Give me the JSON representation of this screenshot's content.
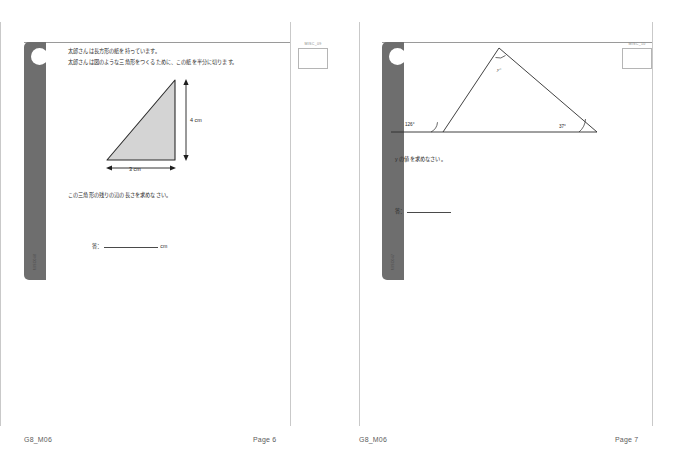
{
  "document": {
    "worksheet_code": "G8_M06"
  },
  "pages": [
    {
      "id": "page-6",
      "code_box_label": "MISC_09",
      "binder_id": "MISC048",
      "stem_lines": [
        "太郎さんは長方形の紙を持っています。",
        "太郎さんは図のような三角形をつくるために、この紙を半分に切ります。"
      ],
      "figure": {
        "type": "right-triangle",
        "vertical_label": "4 cm",
        "base_label": "3 cm"
      },
      "prompt": "この三角形の残りの辺の長さを求めなさい。",
      "answer": {
        "label": "答：",
        "value": "",
        "unit": "cm"
      },
      "footer": {
        "left": "G8_M06",
        "right": "Page 6"
      }
    },
    {
      "id": "page-7",
      "code_box_label": "MISC_10",
      "binder_id": "MISC047",
      "stem_lines": [],
      "figure": {
        "type": "triangle-with-exterior-angle",
        "apex_label": "y°",
        "left_exterior_label": "126°",
        "right_label": "37°"
      },
      "prompt": "y の値を求めなさい。",
      "answer": {
        "label": "答：",
        "value": "",
        "unit": ""
      },
      "footer": {
        "left": "G8_M06",
        "right": "Page 7"
      }
    }
  ],
  "colors": {
    "binder": "#6e6e6e",
    "rule": "#9a9a9a",
    "figure_fill": "#d4d4d4",
    "figure_stroke": "#2b2b2b",
    "text": "#2a2a2a",
    "footer_text": "#5c5c5c"
  }
}
